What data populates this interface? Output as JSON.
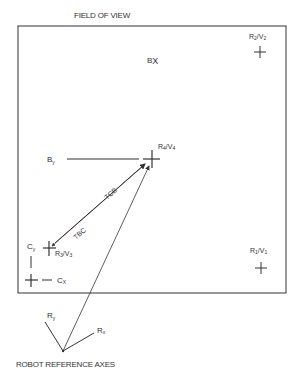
{
  "title": "FIELD OF VIEW",
  "footer": "ROBOT REFERENCE AXES",
  "points": [
    {
      "id": "r2v2",
      "label": "R2/V2",
      "main": "R",
      "sub1": "2",
      "mid": "/V",
      "sub2": "2"
    },
    {
      "id": "r4v4",
      "label": "R4/V4",
      "main": "R",
      "sub1": "4",
      "mid": "/V",
      "sub2": "4"
    },
    {
      "id": "r3v3",
      "label": "R3/V3",
      "main": "R",
      "sub1": "3",
      "mid": "/V",
      "sub2": "3"
    },
    {
      "id": "r1v1",
      "label": "R1/V1",
      "main": "R",
      "sub1": "1",
      "mid": "/V",
      "sub2": "1"
    }
  ],
  "axes_labels": {
    "bx": {
      "main": "B",
      "sub": "X"
    },
    "by": {
      "main": "B",
      "sub": "y"
    },
    "cy": {
      "main": "C",
      "sub": "y"
    },
    "cx": {
      "main": "C",
      "sub": "X"
    },
    "ry": {
      "main": "R",
      "sub": "y"
    },
    "rx": {
      "main": "R",
      "sub": "x"
    }
  },
  "vectors": {
    "tcb": "TCB",
    "tbc": "TBC"
  },
  "colors": {
    "line": "#333333",
    "text": "#333333",
    "background": "#ffffff"
  }
}
